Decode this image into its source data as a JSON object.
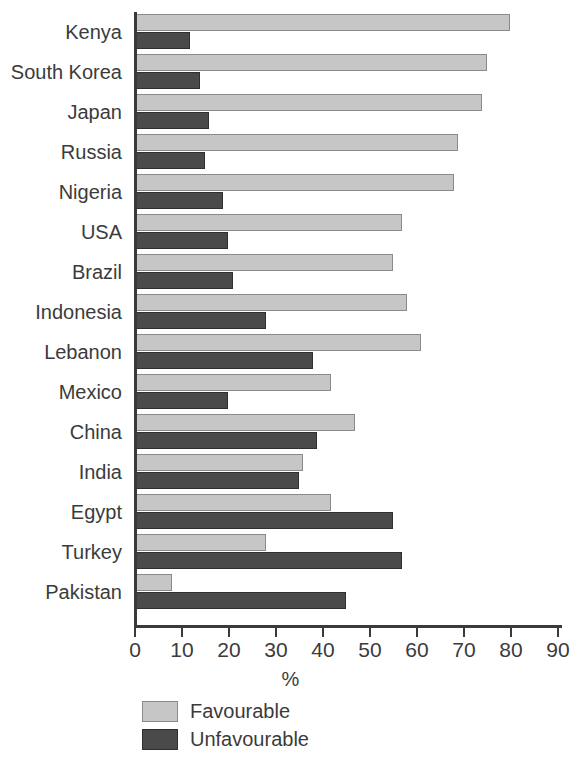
{
  "chart_data": {
    "type": "bar",
    "orientation": "horizontal",
    "title": "",
    "xlabel": "%",
    "ylabel": "",
    "xlim": [
      0,
      90
    ],
    "xticks": [
      0,
      10,
      20,
      30,
      40,
      50,
      60,
      70,
      80,
      90
    ],
    "grid": false,
    "legend_position": "bottom-left",
    "categories": [
      "Kenya",
      "South Korea",
      "Japan",
      "Russia",
      "Nigeria",
      "USA",
      "Brazil",
      "Indonesia",
      "Lebanon",
      "Mexico",
      "China",
      "India",
      "Egypt",
      "Turkey",
      "Pakistan"
    ],
    "series": [
      {
        "name": "Favourable",
        "color": "#c6c6c6",
        "values": [
          80,
          75,
          74,
          69,
          68,
          57,
          55,
          58,
          61,
          42,
          47,
          36,
          42,
          28,
          8
        ]
      },
      {
        "name": "Unfavourable",
        "color": "#4a4a4a",
        "values": [
          12,
          14,
          16,
          15,
          19,
          20,
          21,
          28,
          38,
          20,
          39,
          35,
          55,
          57,
          45
        ]
      }
    ]
  },
  "legend": {
    "items": [
      {
        "label": "Favourable",
        "swatch": "fav"
      },
      {
        "label": "Unfavourable",
        "swatch": "unfav"
      }
    ]
  }
}
